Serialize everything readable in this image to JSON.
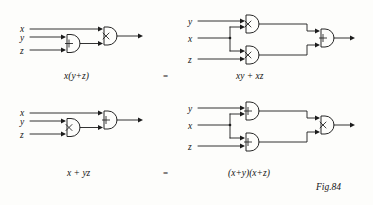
{
  "figure": {
    "caption": "Fig.84",
    "equality_symbol": "="
  },
  "identities": [
    {
      "id": "distributive-and-over-or",
      "left_expression": "x(y+z)",
      "right_expression": "xy + xz",
      "left_circuit": {
        "inputs": [
          "x",
          "y",
          "z"
        ],
        "gates": [
          {
            "name": "or-gate",
            "symbol": "+",
            "inputs": [
              "y",
              "z"
            ]
          },
          {
            "name": "and-gate",
            "symbol": "×",
            "inputs": [
              "x",
              "or-gate"
            ]
          }
        ],
        "output": "x(y+z)"
      },
      "right_circuit": {
        "inputs": [
          "y",
          "x",
          "z"
        ],
        "gates": [
          {
            "name": "and-gate-top",
            "symbol": "×",
            "inputs": [
              "y",
              "x"
            ]
          },
          {
            "name": "and-gate-bottom",
            "symbol": "×",
            "inputs": [
              "x",
              "z"
            ]
          },
          {
            "name": "or-gate-out",
            "symbol": "+",
            "inputs": [
              "and-gate-top",
              "and-gate-bottom"
            ]
          }
        ],
        "output": "xy + xz"
      }
    },
    {
      "id": "distributive-or-over-and",
      "left_expression": "x + yz",
      "right_expression": "(x+y)(x+z)",
      "left_circuit": {
        "inputs": [
          "x",
          "y",
          "z"
        ],
        "gates": [
          {
            "name": "and-gate",
            "symbol": "×",
            "inputs": [
              "y",
              "z"
            ]
          },
          {
            "name": "or-gate",
            "symbol": "+",
            "inputs": [
              "x",
              "and-gate"
            ]
          }
        ],
        "output": "x + yz"
      },
      "right_circuit": {
        "inputs": [
          "y",
          "x",
          "z"
        ],
        "gates": [
          {
            "name": "or-gate-top",
            "symbol": "+",
            "inputs": [
              "y",
              "x"
            ]
          },
          {
            "name": "or-gate-bottom",
            "symbol": "+",
            "inputs": [
              "x",
              "z"
            ]
          },
          {
            "name": "and-gate-out",
            "symbol": "×",
            "inputs": [
              "or-gate-top",
              "or-gate-bottom"
            ]
          }
        ],
        "output": "(x+y)(x+z)"
      }
    }
  ],
  "labels": {
    "r1_left_in_x": "x",
    "r1_left_in_y": "y",
    "r1_left_in_z": "z",
    "r1_right_in_y": "y",
    "r1_right_in_x": "x",
    "r1_right_in_z": "z",
    "r2_left_in_x": "x",
    "r2_left_in_y": "y",
    "r2_left_in_z": "z",
    "r2_right_in_y": "y",
    "r2_right_in_x": "x",
    "r2_right_in_z": "z",
    "r1_left_expr": "x(y+z)",
    "r1_eq": "=",
    "r1_right_expr": "xy + xz",
    "r2_left_expr": "x + yz",
    "r2_eq": "=",
    "r2_right_expr": "(x+y)(x+z)",
    "fig_caption": "Fig.84"
  },
  "colors": {
    "ink": "#1c1c1c",
    "paper": "#fdfdfb"
  }
}
